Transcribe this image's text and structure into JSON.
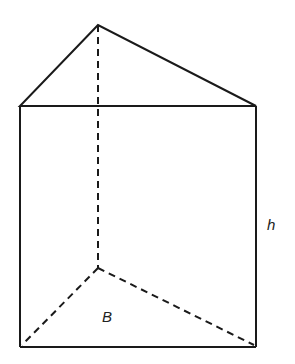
{
  "diagram": {
    "type": "triangular-prism",
    "labels": {
      "height": "h",
      "base": "B"
    },
    "vertices": {
      "top_apex": [
        98,
        25
      ],
      "top_left": [
        20,
        106
      ],
      "top_right": [
        256,
        106
      ],
      "bottom_left": [
        20,
        347
      ],
      "bottom_right": [
        256,
        347
      ],
      "bottom_back": [
        98,
        268
      ]
    },
    "colors": {
      "stroke": "#1a1a1a",
      "background": "#ffffff"
    }
  }
}
